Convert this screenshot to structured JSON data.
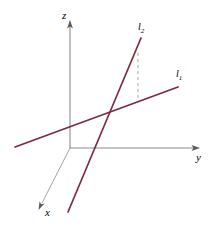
{
  "figure": {
    "kind": "3d-coordinate-diagram",
    "background_color": "#ffffff",
    "axis_color": "#8c8c8c",
    "line_color": "#7d2b3e",
    "dashed_color": "#a0a0a0",
    "axes": [
      {
        "id": "z",
        "label": "z",
        "label_text": "z",
        "orientation": "vertical-up",
        "start": [
          70,
          148
        ],
        "end": [
          70,
          24
        ],
        "arrow": true
      },
      {
        "id": "y",
        "label": "y",
        "label_text": "y",
        "orientation": "horizontal-right",
        "start": [
          70,
          148
        ],
        "end": [
          196,
          148
        ],
        "arrow": true
      },
      {
        "id": "x",
        "label": "x",
        "label_text": "x",
        "orientation": "diagonal-down-left",
        "start": [
          70,
          148
        ],
        "end": [
          40,
          207
        ],
        "arrow": true
      }
    ],
    "lines": [
      {
        "id": "l1",
        "label_text": "l",
        "label_sub": "1",
        "start": [
          15,
          147
        ],
        "end": [
          178,
          87
        ],
        "stroke_width": 1.6
      },
      {
        "id": "l2",
        "label_text": "l",
        "label_sub": "2",
        "start": [
          68,
          212
        ],
        "end": [
          141,
          38
        ],
        "stroke_width": 1.6
      }
    ],
    "dashed_segment": {
      "id": "projection-dashed-line",
      "start": [
        138,
        53
      ],
      "end": [
        138,
        101
      ],
      "dash_pattern": "3,3"
    },
    "intersection_point": [
      105,
      108
    ]
  }
}
